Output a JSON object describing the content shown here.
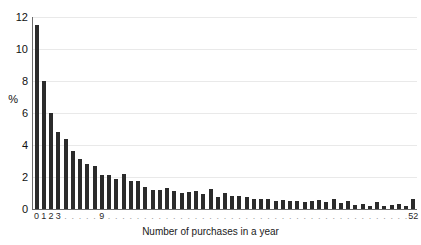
{
  "chart_data": {
    "type": "bar",
    "title": "",
    "subtitle": "",
    "xlabel": "Number of purchases in a year",
    "ylabel": "%",
    "ylim": [
      0,
      12
    ],
    "xlim": [
      -0.5,
      52.5
    ],
    "grid": true,
    "legend": false,
    "legend_position": "none",
    "y_ticks": [
      0,
      2,
      4,
      6,
      8,
      10,
      12
    ],
    "y_tick_labels": [
      "0",
      "2",
      "4",
      "6",
      "8",
      "10",
      "12"
    ],
    "x_visible_tick_labels": [
      "0",
      "1",
      "2",
      "3",
      "9",
      "52"
    ],
    "categories": [
      "0",
      "1",
      "2",
      "3",
      "4",
      "5",
      "6",
      "7",
      "8",
      "9",
      "10",
      "11",
      "12",
      "13",
      "14",
      "15",
      "16",
      "17",
      "18",
      "19",
      "20",
      "21",
      "22",
      "23",
      "24",
      "25",
      "26",
      "27",
      "28",
      "29",
      "30",
      "31",
      "32",
      "33",
      "34",
      "35",
      "36",
      "37",
      "38",
      "39",
      "40",
      "41",
      "42",
      "43",
      "44",
      "45",
      "46",
      "47",
      "48",
      "49",
      "50",
      "51",
      "52"
    ],
    "values": [
      11.5,
      8.0,
      6.0,
      4.8,
      4.35,
      3.6,
      3.15,
      2.8,
      2.7,
      2.15,
      2.1,
      1.9,
      2.2,
      1.75,
      1.75,
      1.35,
      1.2,
      1.2,
      1.3,
      1.1,
      1.0,
      1.05,
      1.1,
      0.95,
      1.25,
      0.75,
      1.0,
      0.8,
      0.8,
      0.75,
      0.6,
      0.6,
      0.6,
      0.5,
      0.55,
      0.5,
      0.5,
      0.45,
      0.5,
      0.55,
      0.45,
      0.6,
      0.4,
      0.5,
      0.25,
      0.3,
      0.2,
      0.45,
      0.2,
      0.25,
      0.3,
      0.2,
      0.65
    ],
    "bar_color": "#2b2b2b",
    "gridline_color": "#e9e9e9",
    "axis_color": "#6b6b6b",
    "background_color": "#ffffff"
  }
}
